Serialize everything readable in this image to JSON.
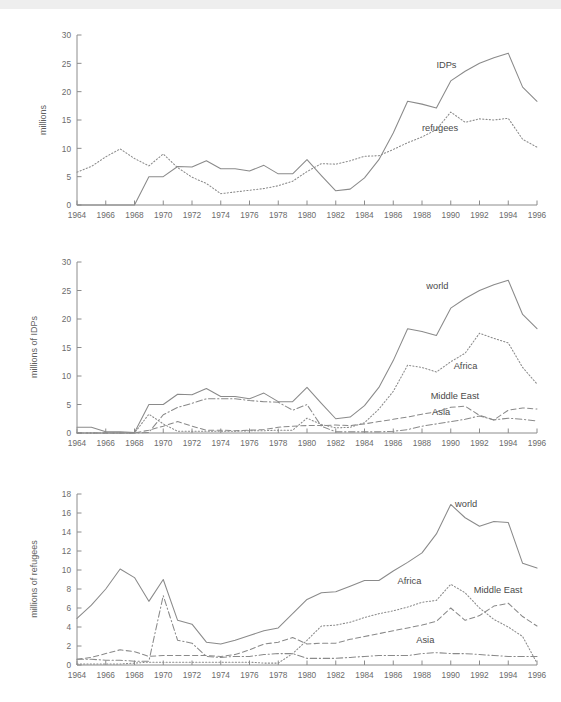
{
  "figure": {
    "background": "#ffffff",
    "line_color": "#8a8a8a",
    "text_color": "#5f5f5f",
    "top_band_color": "#eeeeee"
  },
  "chart_data": [
    {
      "type": "line",
      "title": "",
      "xlabel": "",
      "ylabel": "millions",
      "xlim": [
        1964,
        1996
      ],
      "ylim": [
        0,
        30
      ],
      "yticks": [
        0,
        5,
        10,
        15,
        20,
        25,
        30
      ],
      "xticks": [
        1964,
        1966,
        1968,
        1970,
        1972,
        1974,
        1976,
        1978,
        1980,
        1982,
        1984,
        1986,
        1988,
        1990,
        1992,
        1994,
        1996
      ],
      "grid": false,
      "legend": "inline-annotations",
      "x": [
        1964,
        1965,
        1966,
        1967,
        1968,
        1969,
        1970,
        1971,
        1972,
        1973,
        1974,
        1975,
        1976,
        1977,
        1978,
        1979,
        1980,
        1981,
        1982,
        1983,
        1984,
        1985,
        1986,
        1987,
        1988,
        1989,
        1990,
        1991,
        1992,
        1993,
        1994,
        1995,
        1996
      ],
      "series": [
        {
          "name": "IDPs",
          "style": "solid",
          "label_x": 1989.0,
          "label_y": 24.2,
          "values": [
            0,
            0,
            0,
            0,
            0,
            5.0,
            5.0,
            6.8,
            6.7,
            7.8,
            6.4,
            6.4,
            6.0,
            7.0,
            5.5,
            5.5,
            8.0,
            5.2,
            2.5,
            2.8,
            4.8,
            8.0,
            12.7,
            18.3,
            17.8,
            17.1,
            21.9,
            23.6,
            25.0,
            26.0,
            26.8,
            20.8,
            18.3
          ]
        },
        {
          "name": "refugees",
          "style": "dotted",
          "label_x": 1988.0,
          "label_y": 13.0,
          "values": [
            5.8,
            6.8,
            8.5,
            9.9,
            8.2,
            6.9,
            9.0,
            6.6,
            4.9,
            3.8,
            2.0,
            2.3,
            2.6,
            2.9,
            3.4,
            4.2,
            5.9,
            7.3,
            7.2,
            7.8,
            8.6,
            8.7,
            9.8,
            11.0,
            12.0,
            13.3,
            16.4,
            14.6,
            15.2,
            15.0,
            15.3,
            11.6,
            10.2
          ]
        }
      ]
    },
    {
      "type": "line",
      "title": "",
      "xlabel": "",
      "ylabel": "millions of IDPs",
      "xlim": [
        1964,
        1996
      ],
      "ylim": [
        0,
        30
      ],
      "yticks": [
        0,
        5,
        10,
        15,
        20,
        25,
        30
      ],
      "xticks": [
        1964,
        1966,
        1968,
        1970,
        1972,
        1974,
        1976,
        1978,
        1980,
        1982,
        1984,
        1986,
        1988,
        1990,
        1992,
        1994,
        1996
      ],
      "grid": false,
      "legend": "inline-annotations",
      "x": [
        1964,
        1965,
        1966,
        1967,
        1968,
        1969,
        1970,
        1971,
        1972,
        1973,
        1974,
        1975,
        1976,
        1977,
        1978,
        1979,
        1980,
        1981,
        1982,
        1983,
        1984,
        1985,
        1986,
        1987,
        1988,
        1989,
        1990,
        1991,
        1992,
        1993,
        1994,
        1995,
        1996
      ],
      "series": [
        {
          "name": "world",
          "style": "solid",
          "label_x": 1988.3,
          "label_y": 25.3,
          "values": [
            1.0,
            1.0,
            0.2,
            0.2,
            0.1,
            5.0,
            5.0,
            6.8,
            6.7,
            7.8,
            6.4,
            6.4,
            6.0,
            7.0,
            5.5,
            5.5,
            8.0,
            5.2,
            2.5,
            2.8,
            4.8,
            8.0,
            12.7,
            18.3,
            17.8,
            17.1,
            21.9,
            23.6,
            25.0,
            26.0,
            26.8,
            20.8,
            18.3
          ]
        },
        {
          "name": "Africa",
          "style": "dotted",
          "label_x": 1990.2,
          "label_y": 11.2,
          "values": [
            0,
            0,
            0,
            0,
            0,
            3.3,
            1.6,
            0.3,
            0.3,
            0.3,
            0.3,
            0.3,
            0.4,
            0.4,
            0.5,
            0.5,
            2.6,
            1.5,
            0.9,
            1.0,
            1.8,
            4.2,
            7.3,
            11.9,
            11.5,
            10.7,
            12.5,
            14.0,
            17.5,
            16.6,
            15.8,
            11.5,
            8.6
          ]
        },
        {
          "name": "Middle East",
          "style": "dashed",
          "label_x": 1988.6,
          "label_y": 6.0,
          "values": [
            0,
            0,
            0,
            0,
            0,
            0.5,
            1.2,
            2.0,
            1.2,
            0.5,
            0.5,
            0.4,
            0.5,
            0.6,
            1.0,
            1.2,
            1.3,
            1.3,
            1.4,
            1.3,
            1.6,
            2.0,
            2.4,
            2.8,
            3.3,
            3.7,
            4.5,
            4.7,
            3.1,
            2.3,
            4.0,
            4.4,
            4.2
          ]
        },
        {
          "name": "Asia",
          "style": "dashdot",
          "label_x": 1988.7,
          "label_y": 3.2,
          "values": [
            0,
            0,
            0,
            0,
            0,
            0.1,
            3.2,
            4.5,
            5.2,
            6.0,
            6.0,
            6.0,
            5.7,
            5.5,
            5.4,
            4.0,
            5.0,
            1.2,
            0.2,
            0.2,
            0.2,
            0.2,
            0.3,
            0.6,
            1.2,
            1.6,
            2.0,
            2.4,
            3.0,
            2.3,
            2.6,
            2.4,
            2.1
          ]
        }
      ]
    },
    {
      "type": "line",
      "title": "",
      "xlabel": "",
      "ylabel": "millions of refugees",
      "xlim": [
        1964,
        1996
      ],
      "ylim": [
        0,
        18
      ],
      "yticks": [
        0,
        2,
        4,
        6,
        8,
        10,
        12,
        14,
        16,
        18
      ],
      "xticks": [
        1964,
        1966,
        1968,
        1970,
        1972,
        1974,
        1976,
        1978,
        1980,
        1982,
        1984,
        1986,
        1988,
        1990,
        1992,
        1994,
        1996
      ],
      "grid": false,
      "legend": "inline-annotations",
      "x": [
        1964,
        1965,
        1966,
        1967,
        1968,
        1969,
        1970,
        1971,
        1972,
        1973,
        1974,
        1975,
        1976,
        1977,
        1978,
        1979,
        1980,
        1981,
        1982,
        1983,
        1984,
        1985,
        1986,
        1987,
        1988,
        1989,
        1990,
        1991,
        1992,
        1993,
        1994,
        1995,
        1996
      ],
      "series": [
        {
          "name": "world",
          "style": "solid",
          "label_x": 1990.3,
          "label_y": 16.6,
          "values": [
            4.9,
            6.3,
            8.0,
            10.1,
            9.2,
            6.7,
            9.0,
            4.7,
            4.3,
            2.4,
            2.2,
            2.6,
            3.1,
            3.6,
            3.9,
            5.4,
            6.9,
            7.6,
            7.7,
            8.3,
            8.9,
            8.9,
            9.9,
            10.8,
            11.8,
            13.8,
            16.9,
            15.5,
            14.6,
            15.1,
            15.0,
            10.7,
            10.2
          ]
        },
        {
          "name": "Africa",
          "style": "dotted",
          "label_x": 1986.3,
          "label_y": 8.5,
          "values": [
            0.1,
            0.1,
            0.1,
            0.1,
            0.2,
            0.3,
            0.3,
            0.3,
            0.3,
            0.3,
            0.3,
            0.3,
            0.3,
            0.2,
            0.2,
            1.2,
            2.6,
            4.1,
            4.2,
            4.5,
            5.0,
            5.4,
            5.7,
            6.1,
            6.6,
            6.8,
            8.5,
            7.6,
            6.0,
            4.8,
            4.0,
            3.0,
            0.2
          ]
        },
        {
          "name": "Middle East",
          "style": "dashed",
          "label_x": 1991.6,
          "label_y": 7.6,
          "values": [
            0.6,
            0.8,
            1.2,
            1.6,
            1.4,
            0.9,
            1.0,
            1.0,
            1.0,
            1.0,
            0.9,
            1.1,
            1.6,
            2.2,
            2.4,
            2.9,
            2.2,
            2.3,
            2.3,
            2.7,
            3.0,
            3.3,
            3.6,
            3.9,
            4.2,
            4.6,
            6.0,
            4.7,
            5.2,
            6.2,
            6.5,
            5.1,
            4.1
          ]
        },
        {
          "name": "Asia",
          "style": "dashdot",
          "label_x": 1987.6,
          "label_y": 2.3,
          "values": [
            0.6,
            0.6,
            0.5,
            0.5,
            0.4,
            0.4,
            7.3,
            2.6,
            2.3,
            0.9,
            0.8,
            0.9,
            0.9,
            1.1,
            1.2,
            1.2,
            0.7,
            0.7,
            0.7,
            0.8,
            0.9,
            1.0,
            1.0,
            1.0,
            1.2,
            1.3,
            1.2,
            1.2,
            1.1,
            1.0,
            0.9,
            0.9,
            0.9
          ]
        }
      ]
    }
  ]
}
